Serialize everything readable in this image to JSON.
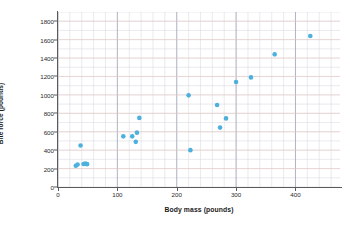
{
  "chart_data": {
    "type": "scatter",
    "title": "",
    "xlabel": "Body mass (pounds)",
    "ylabel": "Bite force (pounds)",
    "xlim": [
      0,
      475
    ],
    "ylim": [
      0,
      1900
    ],
    "xticks": [
      0,
      100,
      200,
      300,
      400
    ],
    "yticks": [
      0,
      200,
      400,
      600,
      800,
      1000,
      1200,
      1400,
      1600,
      1800
    ],
    "grid": true,
    "minor_grid": true,
    "legend": "none",
    "marker_color": "#4db0dd",
    "points": [
      {
        "x": 30,
        "y": 230
      },
      {
        "x": 33,
        "y": 245
      },
      {
        "x": 38,
        "y": 450
      },
      {
        "x": 43,
        "y": 250
      },
      {
        "x": 46,
        "y": 255
      },
      {
        "x": 49,
        "y": 248
      },
      {
        "x": 110,
        "y": 550
      },
      {
        "x": 125,
        "y": 550
      },
      {
        "x": 131,
        "y": 490
      },
      {
        "x": 133,
        "y": 590
      },
      {
        "x": 137,
        "y": 750
      },
      {
        "x": 220,
        "y": 995
      },
      {
        "x": 223,
        "y": 400
      },
      {
        "x": 268,
        "y": 890
      },
      {
        "x": 273,
        "y": 645
      },
      {
        "x": 283,
        "y": 745
      },
      {
        "x": 300,
        "y": 1140
      },
      {
        "x": 325,
        "y": 1190
      },
      {
        "x": 365,
        "y": 1440
      },
      {
        "x": 425,
        "y": 1640
      }
    ]
  },
  "axes": {
    "ylabel_text": "Bite force (pounds)",
    "xlabel_text": "Body mass (pounds)"
  }
}
